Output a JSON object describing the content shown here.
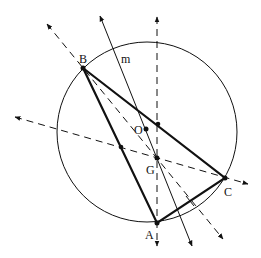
{
  "diagram": {
    "points": {
      "A": {
        "label": "A"
      },
      "B": {
        "label": "B"
      },
      "C": {
        "label": "C"
      },
      "O": {
        "label": "O"
      },
      "G": {
        "label": "G"
      }
    },
    "line_labels": {
      "m": "m"
    },
    "elements": [
      {
        "type": "circle",
        "name": "circumcircle",
        "through": [
          "A",
          "B",
          "C"
        ],
        "center": "O"
      },
      {
        "type": "triangle",
        "name": "triangle-abc",
        "vertices": [
          "A",
          "B",
          "C"
        ],
        "style": "solid-thick"
      },
      {
        "type": "line",
        "name": "line-m",
        "style": "solid",
        "through": [
          "O",
          "G"
        ],
        "arrows": "both"
      },
      {
        "type": "line",
        "name": "median-from-a",
        "style": "dashed",
        "through": [
          "A",
          "G",
          "midpoint-BC"
        ],
        "arrows": "both"
      },
      {
        "type": "line",
        "name": "median-from-b",
        "style": "dashed",
        "through": [
          "B",
          "G",
          "midpoint-AC"
        ],
        "arrows": "both"
      },
      {
        "type": "line",
        "name": "median-from-c",
        "style": "dashed",
        "through": [
          "C",
          "G",
          "midpoint-AB"
        ],
        "arrows": "both"
      }
    ],
    "marked_points": [
      "A",
      "B",
      "C",
      "O",
      "G",
      "midpoint-AB",
      "midpoint-BC"
    ]
  }
}
